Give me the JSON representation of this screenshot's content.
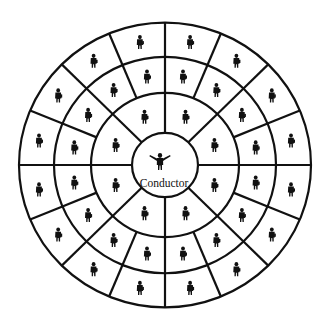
{
  "diagram": {
    "type": "concentric-seating-chart",
    "center": {
      "x": 165,
      "y": 165
    },
    "scale_y": 0.975,
    "line_color": "#111111",
    "background": "#ffffff",
    "rings": [
      {
        "name": "conductor-circle",
        "radius": 33
      },
      {
        "name": "inner-ring-boundary",
        "radius": 74
      },
      {
        "name": "middle-ring-boundary",
        "radius": 111
      },
      {
        "name": "outer-ring-boundary",
        "radius": 146
      }
    ],
    "sections": [
      {
        "name": "inner-ring",
        "r_in": 33,
        "r_out": 74,
        "divisions": 8,
        "angle_offset_deg": 0,
        "musicians_per_cell": 1
      },
      {
        "name": "middle-ring",
        "r_in": 74,
        "r_out": 111,
        "divisions": 16,
        "angle_offset_deg": 0,
        "musicians_per_cell": 1
      },
      {
        "name": "outer-ring",
        "r_in": 111,
        "r_out": 146,
        "divisions": 16,
        "angle_offset_deg": 0,
        "musicians_per_cell": 1
      }
    ],
    "conductor": {
      "label": "Conductor",
      "figure_x": 160,
      "figure_y": 161,
      "label_x": 164,
      "label_y": 187
    },
    "counts": {
      "inner_ring_musicians": 8,
      "middle_ring_musicians": 16,
      "outer_ring_musicians": 16,
      "total_musicians": 40
    }
  }
}
